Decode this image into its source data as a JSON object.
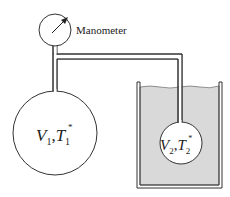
{
  "diagram": {
    "manometer_label": "Manometer",
    "bulb1": {
      "v_symbol": "V",
      "v_sub": "1",
      "sep": ",",
      "t_symbol": "T",
      "t_sub": "1",
      "t_sup": "*"
    },
    "bulb2": {
      "v_symbol": "V",
      "v_sub": "2",
      "sep": ",",
      "t_symbol": "T",
      "t_sub": "2",
      "t_sup": "*"
    },
    "colors": {
      "line": "#333333",
      "liquid": "#d9d9d9",
      "background": "#ffffff"
    }
  }
}
